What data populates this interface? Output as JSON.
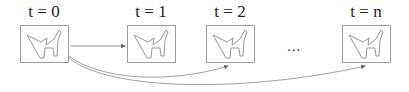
{
  "diagram": {
    "frames": [
      {
        "label": "t = 0",
        "x": 20,
        "cx": 44
      },
      {
        "label": "t = 1",
        "x": 127,
        "cx": 151
      },
      {
        "label": "t = 2",
        "x": 206,
        "cx": 230
      },
      {
        "label": "t = n",
        "x": 342,
        "cx": 366
      }
    ],
    "ellipsis": "...",
    "arrows": [
      {
        "from": "t = 0",
        "to": "t = 1",
        "style": "straight"
      },
      {
        "from": "t = 0",
        "to": "t = 2",
        "style": "curved"
      },
      {
        "from": "t = 0",
        "to": "t = n",
        "style": "curved"
      }
    ],
    "colors": {
      "frame_border": "#9a9a9a",
      "shape_stroke": "#8a8a8a",
      "arrow": "#666666",
      "text": "#222222"
    }
  }
}
